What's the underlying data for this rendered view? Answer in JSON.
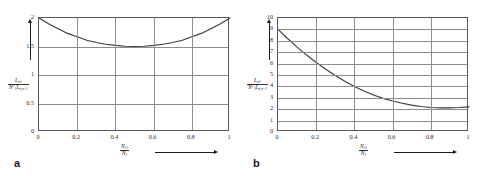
{
  "figure": {
    "background": "#ffffff",
    "axis_color": "#58585a",
    "grid_color": "#8d8d8f",
    "curve_color": "#3a3a3a"
  },
  "panels": [
    {
      "letter": "a",
      "chart_data": {
        "type": "line",
        "title": "",
        "xlabel_num": "N",
        "xlabel_num_sub": "11",
        "xlabel_den": "N",
        "xlabel_den_sub": "1",
        "ylabel_num": "L",
        "ylabel_num_sub": "σ1",
        "ylabel_den": "N",
        "ylabel_den_sup": "2",
        "ylabel_den_sub": "1",
        "ylabel_den_tail": "L",
        "ylabel_den_tail_sub": "σ,σ=1",
        "xlim": [
          0,
          1
        ],
        "ylim": [
          0,
          2
        ],
        "xticks": [
          "0",
          "0.2",
          "0.4",
          "0.6",
          "0.8",
          "1"
        ],
        "xtick_values": [
          0,
          0.2,
          0.4,
          0.6,
          0.8,
          1
        ],
        "yticks": [
          "0",
          "0.5",
          "1",
          "1.5",
          "2"
        ],
        "ytick_values": [
          0,
          0.5,
          1,
          1.5,
          2
        ],
        "grid": true,
        "legend": "none",
        "x": [
          0,
          0.05,
          0.1,
          0.15,
          0.2,
          0.25,
          0.3,
          0.35,
          0.4,
          0.45,
          0.5,
          0.55,
          0.6,
          0.65,
          0.7,
          0.75,
          0.8,
          0.85,
          0.9,
          0.95,
          1
        ],
        "values": [
          2.0,
          1.9,
          1.81,
          1.73,
          1.67,
          1.61,
          1.57,
          1.54,
          1.52,
          1.505,
          1.5,
          1.505,
          1.52,
          1.54,
          1.57,
          1.61,
          1.67,
          1.73,
          1.81,
          1.9,
          2.0
        ]
      }
    },
    {
      "letter": "b",
      "chart_data": {
        "type": "line",
        "title": "",
        "xlabel_num": "N",
        "xlabel_num_sub": "11",
        "xlabel_den": "N",
        "xlabel_den_sub": "1",
        "ylabel_num": "L",
        "ylabel_num_sub": "σ1",
        "ylabel_den": "N",
        "ylabel_den_sup": "2",
        "ylabel_den_sub": "1",
        "ylabel_den_tail": "L",
        "ylabel_den_tail_sub": "σ,σ=1",
        "xlim": [
          0,
          1
        ],
        "ylim": [
          0,
          10
        ],
        "xticks": [
          "0",
          "0.2",
          "0.4",
          "0.6",
          "0.8",
          "1"
        ],
        "xtick_values": [
          0,
          0.2,
          0.4,
          0.6,
          0.8,
          1
        ],
        "yticks": [
          "0",
          "1",
          "2",
          "3",
          "4",
          "5",
          "6",
          "7",
          "8",
          "9",
          "10"
        ],
        "ytick_values": [
          0,
          1,
          2,
          3,
          4,
          5,
          6,
          7,
          8,
          9,
          10
        ],
        "grid": true,
        "legend": "none",
        "x": [
          0,
          0.05,
          0.1,
          0.15,
          0.2,
          0.25,
          0.3,
          0.35,
          0.4,
          0.45,
          0.5,
          0.55,
          0.6,
          0.65,
          0.7,
          0.75,
          0.8,
          0.85,
          0.9,
          0.95,
          1
        ],
        "values": [
          9.0,
          8.2,
          7.45,
          6.75,
          6.1,
          5.5,
          4.95,
          4.45,
          4.0,
          3.6,
          3.25,
          2.95,
          2.72,
          2.52,
          2.36,
          2.24,
          2.15,
          2.12,
          2.12,
          2.15,
          2.2
        ]
      }
    }
  ]
}
